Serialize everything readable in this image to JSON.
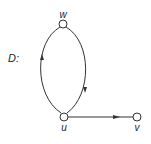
{
  "graph": {
    "name": "D:",
    "nodes": [
      {
        "id": "w",
        "label": "w"
      },
      {
        "id": "u",
        "label": "u"
      },
      {
        "id": "v",
        "label": "v"
      }
    ],
    "edges": [
      {
        "from": "w",
        "to": "u",
        "style": "curved-right"
      },
      {
        "from": "u",
        "to": "w",
        "style": "curved-left"
      },
      {
        "from": "u",
        "to": "v",
        "style": "straight"
      }
    ]
  },
  "colors": {
    "stroke": "#333333",
    "node_fill": "#ffffff"
  }
}
